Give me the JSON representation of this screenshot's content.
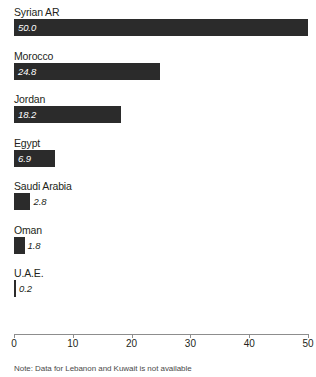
{
  "chart_data": {
    "type": "bar",
    "orientation": "horizontal",
    "title": "",
    "subtitle": "",
    "xlabel": "",
    "ylabel": "",
    "xlim": [
      0,
      50
    ],
    "grid": false,
    "legend": null,
    "categories": [
      "Syrian AR",
      "Morocco",
      "Jordan",
      "Egypt",
      "Saudi Arabia",
      "Oman",
      "U.A.E."
    ],
    "values": [
      50.0,
      24.8,
      18.2,
      6.9,
      2.8,
      1.8,
      0.2
    ],
    "value_labels": [
      "50.0",
      "24.8",
      "18.2",
      "6.9",
      "2.8",
      "1.8",
      "0.2"
    ],
    "tick_values": [
      0,
      10,
      20,
      30,
      40,
      50
    ],
    "tick_labels": [
      "0",
      "10",
      "20",
      "30",
      "40",
      "50"
    ],
    "bar_color": "#2b2b2b",
    "axis_color": "#8d8d8d",
    "label_color": "#231f20",
    "value_label_color_inside": "#ffffff",
    "value_label_color_outside": "#231f20",
    "annotation": "Note: Data for Lebanon and Kuwait is not available"
  }
}
